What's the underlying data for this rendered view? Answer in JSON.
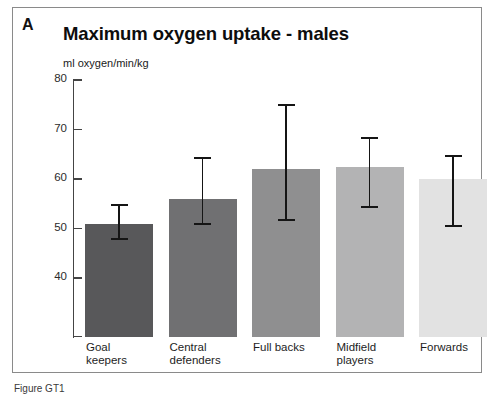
{
  "panel": {
    "letter": "A",
    "title": "Maximum oxygen uptake - males",
    "unit_label": "ml oxygen/min/kg"
  },
  "caption": "Figure GT1",
  "axis": {
    "y_ticks": [
      "80",
      "70",
      "60",
      "50",
      "40"
    ]
  },
  "colors": {
    "bar_1": "#58585a",
    "bar_2": "#707072",
    "bar_3": "#8f8f90",
    "bar_4": "#b3b3b4",
    "bar_5": "#e2e2e2",
    "error_bar": "#151515",
    "axis": "#444444",
    "frame": "#8a8a8a"
  },
  "chart_data": {
    "type": "bar",
    "title": "Maximum oxygen uptake - males",
    "xlabel": "",
    "ylabel": "ml oxygen/min/kg",
    "ylim": [
      35,
      80
    ],
    "yticks": [
      40,
      50,
      60,
      70,
      80
    ],
    "grid": false,
    "legend": "none",
    "error_type": "range",
    "categories": [
      "Goal keepers",
      "Central defenders",
      "Full backs",
      "Midfield players",
      "Forwards"
    ],
    "category_lines": [
      [
        "Goal",
        "keepers"
      ],
      [
        "Central",
        "defenders"
      ],
      [
        "Full backs",
        ""
      ],
      [
        "Midfield",
        "players"
      ],
      [
        "Forwards",
        ""
      ]
    ],
    "values": [
      51.0,
      56.0,
      62.0,
      62.5,
      60.0
    ],
    "error_upper": [
      54.7,
      64.3,
      75.0,
      68.3,
      64.6
    ],
    "error_lower": [
      47.9,
      50.9,
      51.7,
      54.4,
      50.5
    ]
  }
}
